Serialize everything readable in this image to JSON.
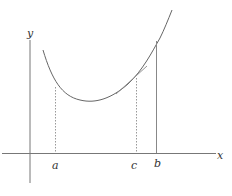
{
  "diagram": {
    "type": "mean value theorem illustration",
    "axes": {
      "x_label": "x",
      "y_label": "y"
    },
    "points": [
      {
        "id": "a",
        "label": "a"
      },
      {
        "id": "c",
        "label": "c"
      },
      {
        "id": "b",
        "label": "b"
      }
    ],
    "colors": {
      "axis": "#777777",
      "curve": "#666666",
      "guide": "#999999"
    }
  }
}
